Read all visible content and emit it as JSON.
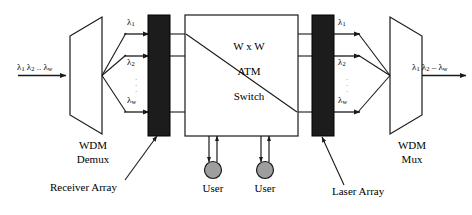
{
  "diagram": {
    "colors": {
      "line": "#1a1a1a",
      "array_fill": "#1c1c1c",
      "user_fill": "#9e9e9e",
      "background": "#ffffff",
      "dots": "#8a8a8a"
    },
    "input": {
      "label_lambda1": "λ",
      "label_sub1": "1",
      "label_lambda2": "λ",
      "label_sub2": "2",
      "label_dots": "..",
      "label_lambdaw": "λ",
      "label_subw": "w",
      "full_text": "λ1 λ2 .. λw"
    },
    "output": {
      "full_text": "λ1 λ2 – λw"
    },
    "blocks": {
      "wdm_demux": {
        "line1": "WDM",
        "line2": "Demux"
      },
      "wdm_mux": {
        "line1": "WDM",
        "line2": "Mux"
      },
      "atm_switch": {
        "line1": "W x W",
        "line2": "ATM",
        "line3": "Switch"
      },
      "receiver_array": {
        "label": "Receiver Array"
      },
      "laser_array": {
        "label": "Laser Array"
      }
    },
    "users": [
      {
        "label": "User"
      },
      {
        "label": "User"
      }
    ],
    "channel_labels_left": [
      {
        "base": "λ",
        "sub": "1"
      },
      {
        "base": "λ",
        "sub": "2"
      },
      {
        "base": "λ",
        "sub": "w"
      }
    ],
    "channel_labels_right": [
      {
        "base": "λ",
        "sub": "1"
      },
      {
        "base": "λ",
        "sub": "2"
      },
      {
        "base": "λ",
        "sub": "w"
      }
    ],
    "icons": {
      "arrowhead": "arrow-head-icon",
      "vertical_dots": "vertical-ellipsis-icon"
    }
  }
}
